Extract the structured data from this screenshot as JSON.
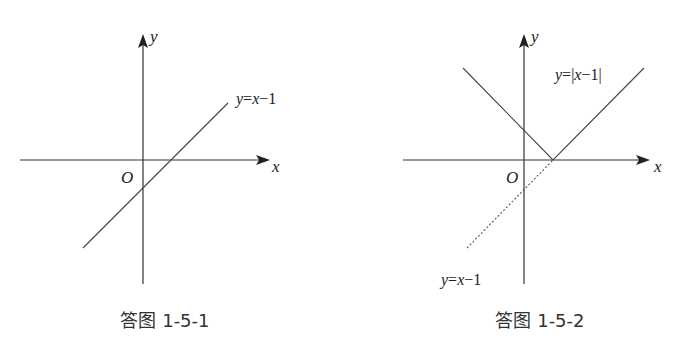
{
  "figures": [
    {
      "caption": "答图 1-5-1",
      "axis_x_label": "x",
      "axis_y_label": "y",
      "origin_label": "O",
      "curves": [
        {
          "label": "y=x−1",
          "style": "solid",
          "equation": "y=x-1"
        }
      ]
    },
    {
      "caption": "答图 1-5-2",
      "axis_x_label": "x",
      "axis_y_label": "y",
      "origin_label": "O",
      "curves": [
        {
          "label": "y=|x−1|",
          "style": "solid",
          "equation": "y=|x-1|"
        },
        {
          "label": "y=x−1",
          "style": "dotted",
          "equation": "y=x-1"
        }
      ]
    }
  ],
  "colors": {
    "line": "#444444",
    "axis": "#333333",
    "background": "#ffffff"
  }
}
